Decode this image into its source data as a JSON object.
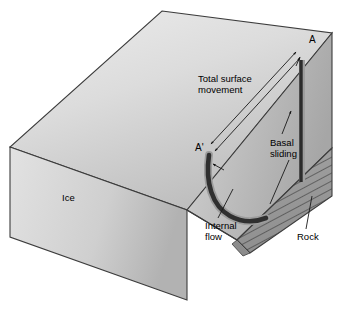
{
  "figure": {
    "kind": "glacier-movement-block-diagram",
    "background_color": "#ffffff",
    "labels": {
      "ice": "Ice",
      "total_surface_movement": "Total surface\nmovement",
      "basal_sliding": "Basal\nsliding",
      "internal_flow": "Internal\nflow",
      "rock": "Rock",
      "marker_a": "A",
      "marker_a_prime": "A'"
    },
    "palette": {
      "ice_top_light": "#e9e9e9",
      "ice_top_dark": "#c0c0c0",
      "ice_front_light": "#dedede",
      "ice_front_dark": "#b4b4b4",
      "ice_right_light": "#d2d2d2",
      "ice_right_dark": "#a8a8a8",
      "rock_fill": "#9a9a9a",
      "rock_hatch": "#4a4a4a",
      "outline": "#3c3c3c",
      "marker_bar": "#2b2b2b",
      "flow_curve_dark": "#2f2f2f",
      "flow_curve_light": "#9d9d9d",
      "leader_line": "#1a1a1a",
      "text": "#000000"
    },
    "elements": {
      "vertical_marker_bar": "A-to-A' reference line drawn in ice at right face",
      "internal_flow_curve": "thick curved arrow from A' bending down-right toward glacier base",
      "surface_movement_arrows": "two thin leader arrows spanning A' to A along the upper surface",
      "rock_wedge": "hatched bedrock wedge beneath the ice at lower right"
    }
  }
}
